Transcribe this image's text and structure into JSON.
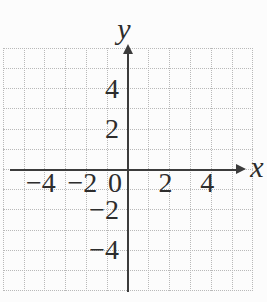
{
  "chart_data": {
    "type": "scatter",
    "title": "",
    "xlabel": "x",
    "ylabel": "y",
    "xlim": [
      -6,
      6
    ],
    "ylim": [
      -6,
      6
    ],
    "grid": {
      "visible": true,
      "style": "dotted",
      "step": 1
    },
    "x_ticks": [
      {
        "value": -4,
        "label": "−4"
      },
      {
        "value": -2,
        "label": "−2"
      },
      {
        "value": 0,
        "label": "0"
      },
      {
        "value": 2,
        "label": "2"
      },
      {
        "value": 4,
        "label": "4"
      }
    ],
    "y_ticks": [
      {
        "value": 4,
        "label": "4"
      },
      {
        "value": 2,
        "label": "2"
      },
      {
        "value": -2,
        "label": "−2"
      },
      {
        "value": -4,
        "label": "−4"
      }
    ],
    "series": [],
    "legend": {
      "visible": false
    },
    "colors": {
      "axis": "#3c3c3c",
      "grid": "#b9b9b9",
      "text": "#2d2d2d",
      "background": "#fcfcfc"
    }
  }
}
